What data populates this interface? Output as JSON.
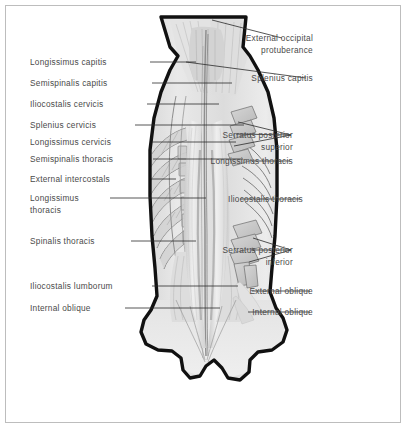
{
  "figure": {
    "type": "anatomical-illustration",
    "border_color": "#bdbdbd",
    "label_color": "#4a4a4a",
    "leader_color": "#2b2b2b",
    "outline_color": "#111111",
    "muscle_fill_light": "#ededed",
    "muscle_fill_mid": "#dcdcdc",
    "muscle_fill_dark": "#c4c4c4",
    "background": "#ffffff"
  },
  "labels_left": [
    {
      "id": "longissimus-capitis",
      "text": "Longissimus capitis",
      "x": 30,
      "y": 57,
      "line_from": [
        150,
        62
      ],
      "line_to": [
        196,
        62
      ]
    },
    {
      "id": "semispinalis-capitis",
      "text": "Semispinalis capitis",
      "x": 30,
      "y": 78,
      "line_from": [
        152,
        83
      ],
      "line_to": [
        232,
        83
      ]
    },
    {
      "id": "iliocostalis-cervicis",
      "text": "Iliocostalis cervicis",
      "x": 30,
      "y": 99,
      "line_from": [
        147,
        104
      ],
      "line_to": [
        219,
        104
      ]
    },
    {
      "id": "splenius-cervicis",
      "text": "Splenius cervicis",
      "x": 30,
      "y": 120,
      "line_from": [
        135,
        125
      ],
      "line_to": [
        244,
        125
      ]
    },
    {
      "id": "longissimus-cervicis",
      "text": "Longissimus cervicis",
      "x": 30,
      "y": 137,
      "line_from": [
        152,
        142
      ],
      "line_to": [
        236,
        142
      ]
    },
    {
      "id": "semispinalis-thoracis",
      "text": "Semispinalis thoracis",
      "x": 30,
      "y": 154,
      "line_from": [
        153,
        159
      ],
      "line_to": [
        243,
        159
      ]
    },
    {
      "id": "external-intercostals",
      "text": "External intercostals",
      "x": 30,
      "y": 174,
      "line_from": [
        151,
        179
      ],
      "line_to": [
        176,
        179
      ]
    },
    {
      "id": "longissimus-thoracis-l",
      "text": "Longissimus",
      "text2": "thoracis",
      "x": 30,
      "y": 193,
      "line_from": [
        110,
        198
      ],
      "line_to": [
        206,
        198
      ]
    },
    {
      "id": "spinalis-thoracis",
      "text": "Spinalis thoracis",
      "x": 30,
      "y": 236,
      "line_from": [
        131,
        241
      ],
      "line_to": [
        196,
        241
      ]
    },
    {
      "id": "iliocostalis-lumborum",
      "text": "Iliocostalis lumborum",
      "x": 30,
      "y": 281,
      "line_from": [
        152,
        286
      ],
      "line_to": [
        238,
        286
      ]
    },
    {
      "id": "internal-oblique-left",
      "text": "Internal oblique",
      "x": 30,
      "y": 303,
      "line_from": [
        125,
        308
      ],
      "line_to": [
        220,
        308
      ]
    }
  ],
  "labels_right": [
    {
      "id": "external-occipital-protuberance",
      "text": "External occipital",
      "text2": "protuberance",
      "x": 313,
      "y": 33,
      "line_from": [
        282,
        38
      ],
      "line_to": [
        212,
        20
      ]
    },
    {
      "id": "splenius-capitis",
      "text": "Splenius capitis",
      "x": 313,
      "y": 73,
      "line_from": [
        306,
        78
      ],
      "line_to": [
        186,
        62
      ]
    },
    {
      "id": "serratus-posterior-superior",
      "text": "Serratus posterior",
      "text2": "superior",
      "x": 293,
      "y": 130,
      "line_from": [
        291,
        135
      ],
      "fan_to": [
        [
          238,
          122
        ],
        [
          236,
          134
        ],
        [
          234,
          146
        ]
      ]
    },
    {
      "id": "longissimus-thoracis-r",
      "text": "Longissimus thoracis",
      "x": 293,
      "y": 156,
      "line_from": [
        290,
        161
      ],
      "line_to": [
        252,
        161
      ]
    },
    {
      "id": "iliocostalis-thoracis",
      "text": "Iliocostalis thoracis",
      "x": 303,
      "y": 194,
      "line_from": [
        300,
        199
      ],
      "line_to": [
        240,
        199
      ]
    },
    {
      "id": "serratus-posterior-inferior",
      "text": "Serratus posterior",
      "text2": "inferior",
      "x": 293,
      "y": 245,
      "line_from": [
        291,
        250
      ],
      "fan_to": [
        [
          253,
          238
        ],
        [
          251,
          250
        ],
        [
          249,
          262
        ]
      ]
    },
    {
      "id": "external-oblique",
      "text": "External oblique",
      "x": 313,
      "y": 286,
      "line_from": [
        310,
        291
      ],
      "line_to": [
        252,
        291
      ]
    },
    {
      "id": "internal-oblique-right",
      "text": "Internal oblique",
      "x": 313,
      "y": 307,
      "line_from": [
        310,
        312
      ],
      "line_to": [
        248,
        312
      ]
    }
  ],
  "anatomy_notes": {
    "regions": [
      "occipital",
      "cervical",
      "thoracic",
      "lumbar",
      "sacral"
    ],
    "described_structures": [
      "erector spinae columns",
      "ribs with external intercostals",
      "serratus posterior superior slips",
      "serratus posterior inferior slips",
      "thoracolumbar fascia",
      "iliac crest notches"
    ]
  }
}
